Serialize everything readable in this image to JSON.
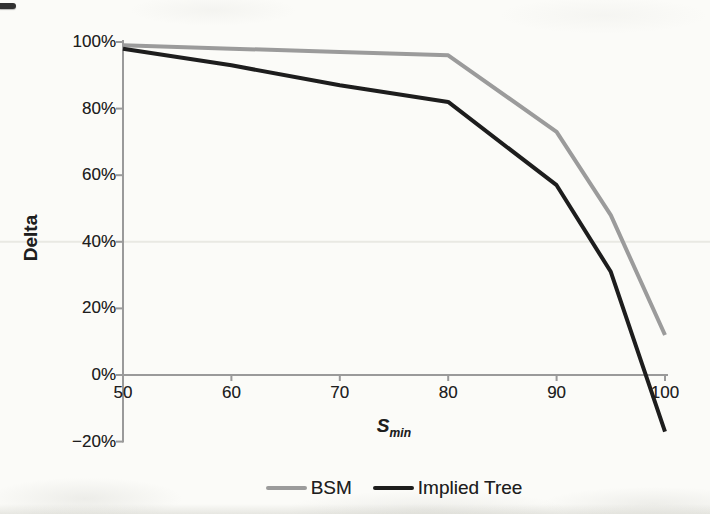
{
  "labels": {
    "ylabel": "Delta",
    "xlabel_main": "S",
    "xlabel_sub": "min"
  },
  "colors": {
    "bsm_line": "#9b9b9b",
    "implied_tree_line": "#1d1d1d",
    "axis": "#9a9a9a",
    "gridline": "#e9e9e3",
    "text": "#1e1e1e",
    "background": "#fbfbf8"
  },
  "chart_data": {
    "type": "line",
    "x": [
      50,
      60,
      70,
      80,
      90,
      95,
      100
    ],
    "series": [
      {
        "name": "BSM",
        "values": [
          99,
          98,
          97,
          96,
          73,
          48,
          12
        ]
      },
      {
        "name": "Implied Tree",
        "values": [
          98,
          93,
          87,
          82,
          57,
          31,
          -17
        ]
      }
    ],
    "title": "",
    "xlabel": "S_min",
    "ylabel": "Delta",
    "xlim": [
      50,
      100
    ],
    "ylim": [
      -20,
      100
    ],
    "xticks": [
      50,
      60,
      70,
      80,
      90,
      100
    ],
    "xtick_labels": [
      "50",
      "60",
      "70",
      "80",
      "90",
      "100"
    ],
    "yticks": [
      100,
      80,
      60,
      40,
      20,
      0,
      -20
    ],
    "ytick_labels": [
      "100%",
      "80%",
      "60%",
      "40%",
      "20%",
      "0%",
      "−20%"
    ],
    "grid": "single faint horizontal gridline at 40%",
    "gridline_y": 40,
    "legend_position": "bottom-center",
    "units": "percent"
  },
  "legend": {
    "items": [
      {
        "label": "BSM",
        "color": "#9b9b9b"
      },
      {
        "label": "Implied Tree",
        "color": "#1d1d1d"
      }
    ]
  }
}
